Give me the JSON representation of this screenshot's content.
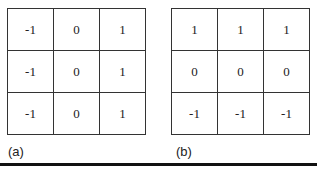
{
  "figures": [
    {
      "label": "(a)",
      "matrix": [
        [
          "-1",
          "0",
          "1"
        ],
        [
          "-1",
          "0",
          "1"
        ],
        [
          "-1",
          "0",
          "1"
        ]
      ]
    },
    {
      "label": "(b)",
      "matrix": [
        [
          "1",
          "1",
          "1"
        ],
        [
          "0",
          "0",
          "0"
        ],
        [
          "-1",
          "-1",
          "-1"
        ]
      ]
    }
  ]
}
